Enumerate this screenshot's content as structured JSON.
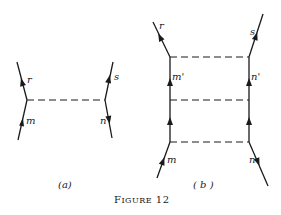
{
  "figure": {
    "title": "FIGURE 12",
    "title_parts": {
      "big_f": "F",
      "rest": "IGURE",
      "number": " 12"
    }
  },
  "panels": [
    {
      "id": "a",
      "caption": "(a)",
      "labels": {
        "top_left": "r",
        "top_right": "s",
        "bottom_left": "m",
        "bottom_right": "n"
      },
      "dashed_lines": 1
    },
    {
      "id": "b",
      "caption": "( b )",
      "labels": {
        "top_left": "r",
        "top_right": "s",
        "mid_left": "m'",
        "mid_right": "n'",
        "bottom_left": "m",
        "bottom_right": "n"
      },
      "dashed_lines": 3
    }
  ],
  "colors": {
    "ink": "#1a1a1a",
    "background": "#ffffff"
  }
}
